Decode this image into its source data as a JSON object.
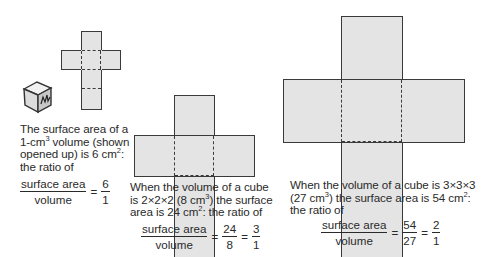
{
  "panels": [
    {
      "id": "1cm",
      "caption": {
        "line1": "The surface area of a",
        "line2_pre": "1-cm",
        "line2_sup": "3",
        "line2_post": " volume (shown",
        "line3_pre": "opened up) is 6 cm",
        "line3_sup": "2",
        "line3_post": ":",
        "line4": "the ratio of"
      },
      "fraction": {
        "numerator": "surface area",
        "denominator": "volume",
        "equals": "=",
        "result_num": "6",
        "result_den": "1"
      }
    },
    {
      "id": "2cm",
      "caption": {
        "line1": "When the volume of a cube",
        "line2_pre": "is 2×2×2 (8 cm",
        "line2_sup": "3",
        "line2_post": ") the surface",
        "line3_pre": "area is 24 cm",
        "line3_sup": "2",
        "line3_post": ": the ratio of"
      },
      "fraction": {
        "numerator": "surface area",
        "denominator": "volume",
        "equals": "=",
        "mid_num": "24",
        "mid_den": "8",
        "result_num": "3",
        "result_den": "1"
      }
    },
    {
      "id": "3cm",
      "caption": {
        "line1": "When the volume of a cube is 3×3×3",
        "line2_pre": "(27 cm",
        "line2_sup": "3",
        "line2_post": ") the surface area is 54 cm",
        "line2_sup2": "2",
        "line2_end": ":",
        "line3": "the ratio of"
      },
      "fraction": {
        "numerator": "surface area",
        "denominator": "volume",
        "equals": "=",
        "mid_num": "54",
        "mid_den": "27",
        "result_num": "2",
        "result_den": "1"
      }
    }
  ],
  "icons": {
    "cube": "cube-icon"
  },
  "colors": {
    "face_fill": "#e4e4e4",
    "outline": "#3a3a3a",
    "text": "#2a2a2a"
  }
}
